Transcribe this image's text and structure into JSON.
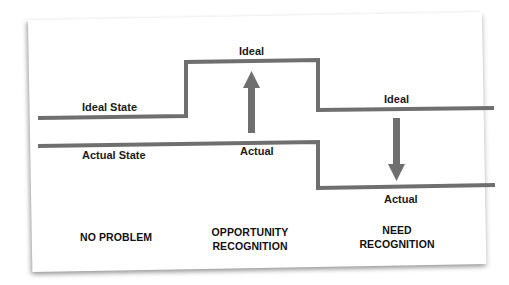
{
  "diagram": {
    "colors": {
      "line": "#6f6f6f",
      "arrow": "#6f6f6f",
      "text": "#1a1a1a",
      "paper": "#ffffff"
    },
    "lines": {
      "ideal_label": "Ideal State",
      "actual_label": "Actual State"
    },
    "markers": {
      "opportunity_ideal": "Ideal",
      "opportunity_actual": "Actual",
      "need_ideal": "Ideal",
      "need_actual": "Actual"
    },
    "arrows": {
      "opportunity": "arrow-up",
      "need": "arrow-down"
    },
    "columns": [
      {
        "line1": "NO PROBLEM",
        "line2": ""
      },
      {
        "line1": "OPPORTUNITY",
        "line2": "RECOGNITION"
      },
      {
        "line1": "NEED",
        "line2": "RECOGNITION"
      }
    ]
  }
}
